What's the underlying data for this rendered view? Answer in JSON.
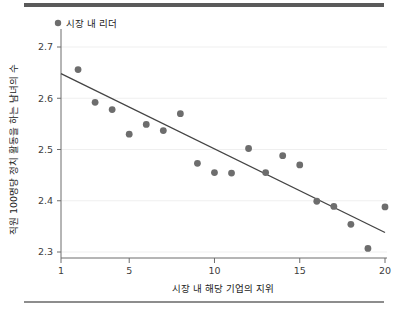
{
  "chart_data": {
    "type": "scatter",
    "title": "",
    "xlabel": "시장 내 해당 기업의 지위",
    "ylabel": "직원 100명당 정치 활동을 하는 남녀의 수",
    "xlim": [
      1,
      20
    ],
    "ylim": [
      2.3,
      2.7
    ],
    "xticks": [
      1,
      5,
      10,
      15,
      20
    ],
    "xtick_labels": [
      "1",
      "5",
      "10",
      "15",
      "20"
    ],
    "yticks": [
      2.3,
      2.4,
      2.5,
      2.6,
      2.7
    ],
    "ytick_labels": [
      "2.3",
      "2.4",
      "2.5",
      "2.6",
      "2.7"
    ],
    "grid": "horizontal",
    "legend": {
      "position": "top-left",
      "entries": [
        {
          "label": "시장 내 리더",
          "marker": "circle",
          "color": "#6d6d6d"
        }
      ]
    },
    "series": [
      {
        "name": "시장 내 리더",
        "marker": "circle",
        "color": "#6d6d6d",
        "points": [
          {
            "x": 2,
            "y": 2.656
          },
          {
            "x": 3,
            "y": 2.592
          },
          {
            "x": 4,
            "y": 2.578
          },
          {
            "x": 5,
            "y": 2.53
          },
          {
            "x": 6,
            "y": 2.549
          },
          {
            "x": 7,
            "y": 2.537
          },
          {
            "x": 8,
            "y": 2.57
          },
          {
            "x": 9,
            "y": 2.473
          },
          {
            "x": 10,
            "y": 2.455
          },
          {
            "x": 11,
            "y": 2.454
          },
          {
            "x": 12,
            "y": 2.502
          },
          {
            "x": 13,
            "y": 2.455
          },
          {
            "x": 14,
            "y": 2.488
          },
          {
            "x": 15,
            "y": 2.47
          },
          {
            "x": 16,
            "y": 2.399
          },
          {
            "x": 17,
            "y": 2.389
          },
          {
            "x": 18,
            "y": 2.354
          },
          {
            "x": 19,
            "y": 2.307
          },
          {
            "x": 20,
            "y": 2.388
          }
        ]
      }
    ],
    "trendline": {
      "name": "선형 추세선",
      "color": "#444444",
      "x_start": 1,
      "y_start": 2.648,
      "x_end": 20,
      "y_end": 2.338
    },
    "colors": {
      "marker": "#6d6d6d",
      "trendline": "#444444",
      "axis": "#6d6d6d",
      "grid": "#efefef",
      "text": "#222222",
      "rule_top": "#5a5a5a",
      "rule_bottom": "#8d8d8d",
      "background": "#ffffff"
    }
  }
}
